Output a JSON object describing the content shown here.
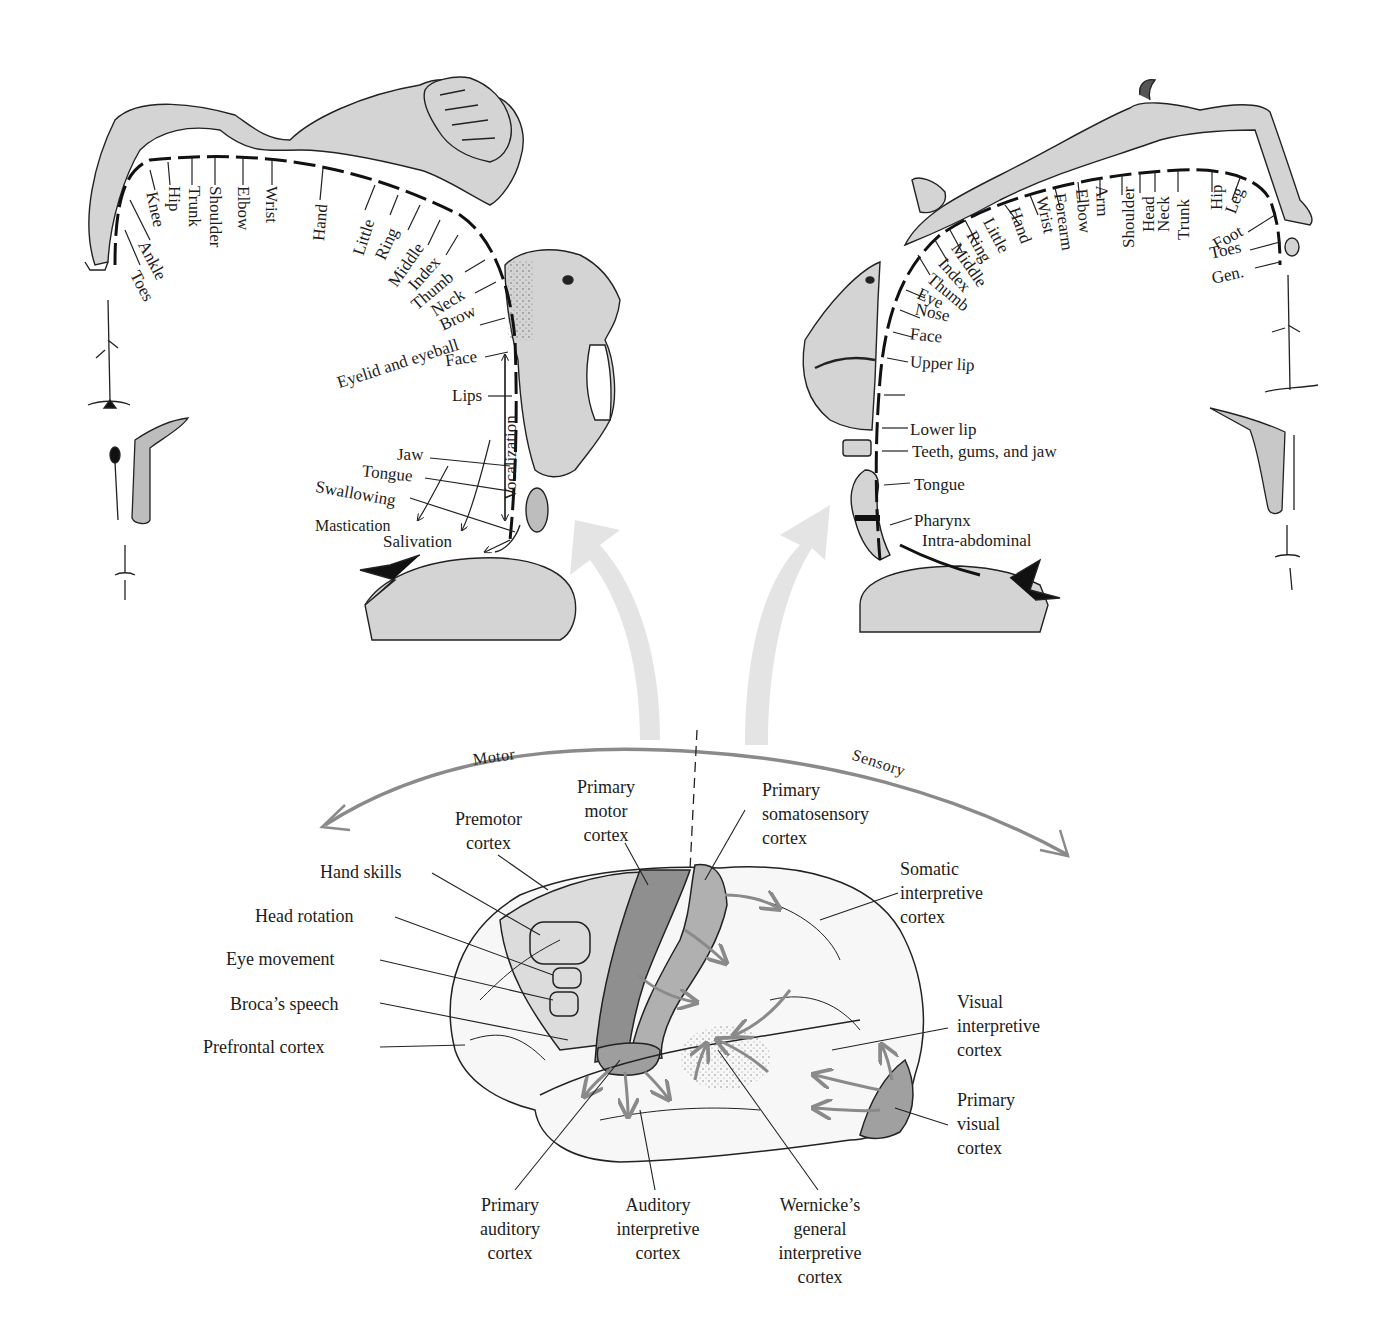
{
  "motor_homunculus": {
    "title": "Motor",
    "body_labels": [
      "Toes",
      "Ankle",
      "Knee",
      "Hip",
      "Trunk",
      "Shoulder",
      "Elbow",
      "Wrist",
      "Hand",
      "Little",
      "Ring",
      "Middle",
      "Index",
      "Thumb",
      "Neck",
      "Brow"
    ],
    "face_labels": [
      "Eyelid and eyeball",
      "Face",
      "Lips",
      "Jaw",
      "Tongue",
      "Swallowing",
      "Mastication",
      "Salivation"
    ],
    "bracket_label": "Vocalization"
  },
  "sensory_homunculus": {
    "title": "Sensory",
    "body_labels": [
      "Thumb",
      "Index",
      "Middle",
      "Ring",
      "Little",
      "Hand",
      "Wrist",
      "Forearm",
      "Elbow",
      "Arm",
      "Shoulder",
      "Head",
      "Neck",
      "Trunk",
      "Hip",
      "Leg",
      "Foot",
      "Toes",
      "Gen."
    ],
    "face_labels": [
      "Eye",
      "Nose",
      "Face",
      "Upper lip",
      "Lower lip",
      "Teeth, gums, and jaw",
      "Tongue",
      "Pharynx",
      "Intra-abdominal"
    ]
  },
  "arc": {
    "left_label": "Motor",
    "right_label": "Sensory"
  },
  "brain": {
    "top_labels": {
      "premotor": "Premotor cortex",
      "premotor_l1": "Premotor",
      "premotor_l2": "cortex",
      "primary_motor_l1": "Primary",
      "primary_motor_l2": "motor",
      "primary_motor_l3": "cortex",
      "somato_l1": "Primary",
      "somato_l2": "somatosensory",
      "somato_l3": "cortex"
    },
    "left_labels": [
      "Hand skills",
      "Head rotation",
      "Eye movement",
      "Broca’s speech",
      "Prefrontal cortex"
    ],
    "right_labels": {
      "somatic_l1": "Somatic",
      "somatic_l2": "interpretive",
      "somatic_l3": "cortex",
      "visual_int_l1": "Visual",
      "visual_int_l2": "interpretive",
      "visual_int_l3": "cortex",
      "primary_visual_l1": "Primary",
      "primary_visual_l2": "visual",
      "primary_visual_l3": "cortex"
    },
    "bottom_labels": {
      "aud_l1": "Primary",
      "aud_l2": "auditory",
      "aud_l3": "cortex",
      "audint_l1": "Auditory",
      "audint_l2": "interpretive",
      "audint_l3": "cortex",
      "wern_l1": "Wernicke’s",
      "wern_l2": "general",
      "wern_l3": "interpretive",
      "wern_l4": "cortex"
    }
  },
  "colors": {
    "figure_fill": "#d4d4d4",
    "motor_strip": "#8f8f8f",
    "sensory_strip": "#b0b0b0",
    "premotor_area": "#dcdcdc",
    "arrow_gray": "#8a8a8a",
    "big_arrow": "#e4e4e4",
    "ink": "#1a1a1a"
  }
}
